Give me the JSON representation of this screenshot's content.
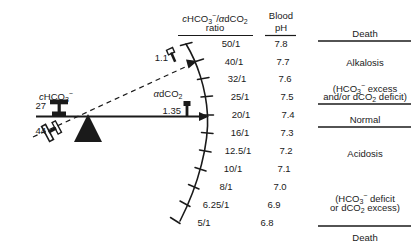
{
  "figure": {
    "type": "balance-beam-nomogram",
    "headers": {
      "ratio_line1_prefix": "c",
      "ratio_line1": "HCO",
      "ratio_numerator": "cHCO₃⁻/αdCO₂",
      "ratio_line2": "ratio",
      "ph_line1": "Blood",
      "ph_line2": "pH"
    },
    "beam": {
      "left_label": "cHCO₃⁻",
      "left_weight_value": "27",
      "left_weight_alt_value": "44",
      "right_label": "αdCO₂",
      "right_weight_value": "1.35",
      "right_weight_alt_value": "1.1"
    },
    "scale_rows": [
      {
        "ratio": "50/1",
        "ph": "7.8"
      },
      {
        "ratio": "40/1",
        "ph": "7.7"
      },
      {
        "ratio": "32/1",
        "ph": "7.6"
      },
      {
        "ratio": "25/1",
        "ph": "7.5"
      },
      {
        "ratio": "20/1",
        "ph": "7.4"
      },
      {
        "ratio": "16/1",
        "ph": "7.3"
      },
      {
        "ratio": "12.5/1",
        "ph": "7.2"
      },
      {
        "ratio": "10/1",
        "ph": "7.1"
      },
      {
        "ratio": "8/1",
        "ph": "7.0"
      },
      {
        "ratio": "6.25/1",
        "ph": "6.9"
      },
      {
        "ratio": "5/1",
        "ph": "6.8"
      }
    ],
    "zones": [
      {
        "name": "death-top",
        "lines": [
          "Death"
        ]
      },
      {
        "name": "alkalosis",
        "lines": [
          "Alkalosis"
        ]
      },
      {
        "name": "alkalosis-detail",
        "lines": [
          "(HCO₃⁻ excess",
          "and/or dCO₂ deficit)"
        ]
      },
      {
        "name": "normal",
        "lines": [
          "Normal"
        ]
      },
      {
        "name": "acidosis",
        "lines": [
          "Acidosis"
        ]
      },
      {
        "name": "acidosis-detail",
        "lines": [
          "(HCO₃⁻ deficit",
          "or dCO₂ excess)"
        ]
      },
      {
        "name": "death-bottom",
        "lines": [
          "Death"
        ]
      }
    ],
    "colors": {
      "ink": "#1a1a1a",
      "background": "#ffffff"
    }
  }
}
